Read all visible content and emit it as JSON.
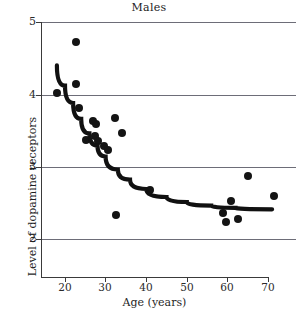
{
  "chart_data": {
    "type": "scatter",
    "title": "Males",
    "xlabel": "Age (years)",
    "ylabel": "Level of dopamine receptors",
    "xlim": [
      15,
      71
    ],
    "ylim": [
      1.55,
      5.0
    ],
    "xticks": [
      20,
      30,
      40,
      50,
      60,
      70
    ],
    "yticks": [
      2,
      3,
      4,
      5
    ],
    "grid": "horizontal",
    "legend": "none",
    "points": [
      {
        "x": 18.0,
        "y": 4.02
      },
      {
        "x": 22.8,
        "y": 4.72
      },
      {
        "x": 22.6,
        "y": 4.14
      },
      {
        "x": 23.4,
        "y": 3.81
      },
      {
        "x": 25.2,
        "y": 3.37
      },
      {
        "x": 27.0,
        "y": 3.63
      },
      {
        "x": 27.6,
        "y": 3.59
      },
      {
        "x": 27.3,
        "y": 3.42
      },
      {
        "x": 28.2,
        "y": 3.36
      },
      {
        "x": 29.5,
        "y": 3.29
      },
      {
        "x": 30.7,
        "y": 3.23
      },
      {
        "x": 32.4,
        "y": 3.67
      },
      {
        "x": 34.1,
        "y": 3.46
      },
      {
        "x": 32.6,
        "y": 2.33
      },
      {
        "x": 41.0,
        "y": 2.67
      },
      {
        "x": 59.0,
        "y": 2.36
      },
      {
        "x": 59.6,
        "y": 2.24
      },
      {
        "x": 60.8,
        "y": 2.52
      },
      {
        "x": 62.5,
        "y": 2.28
      },
      {
        "x": 65.0,
        "y": 2.87
      },
      {
        "x": 71.6,
        "y": 2.59
      }
    ],
    "trend": {
      "label": "exponential-decay-fit",
      "points": [
        {
          "x": 18.0,
          "y": 4.4
        },
        {
          "x": 20.0,
          "y": 4.12
        },
        {
          "x": 22.0,
          "y": 3.88
        },
        {
          "x": 24.0,
          "y": 3.66
        },
        {
          "x": 26.0,
          "y": 3.46
        },
        {
          "x": 28.0,
          "y": 3.29
        },
        {
          "x": 30.0,
          "y": 3.14
        },
        {
          "x": 33.0,
          "y": 2.96
        },
        {
          "x": 36.0,
          "y": 2.82
        },
        {
          "x": 40.0,
          "y": 2.69
        },
        {
          "x": 45.0,
          "y": 2.58
        },
        {
          "x": 50.0,
          "y": 2.51
        },
        {
          "x": 56.0,
          "y": 2.46
        },
        {
          "x": 62.0,
          "y": 2.43
        },
        {
          "x": 71.0,
          "y": 2.41
        }
      ]
    }
  },
  "axis_labels": {
    "x": [
      "20",
      "30",
      "40",
      "50",
      "60",
      "70"
    ],
    "y": [
      "5",
      "4",
      "3",
      "2"
    ]
  },
  "colors": {
    "marker": "#141414",
    "trend": "#111111",
    "grid": "#6d6d78",
    "axis": "#3a3a3a"
  }
}
